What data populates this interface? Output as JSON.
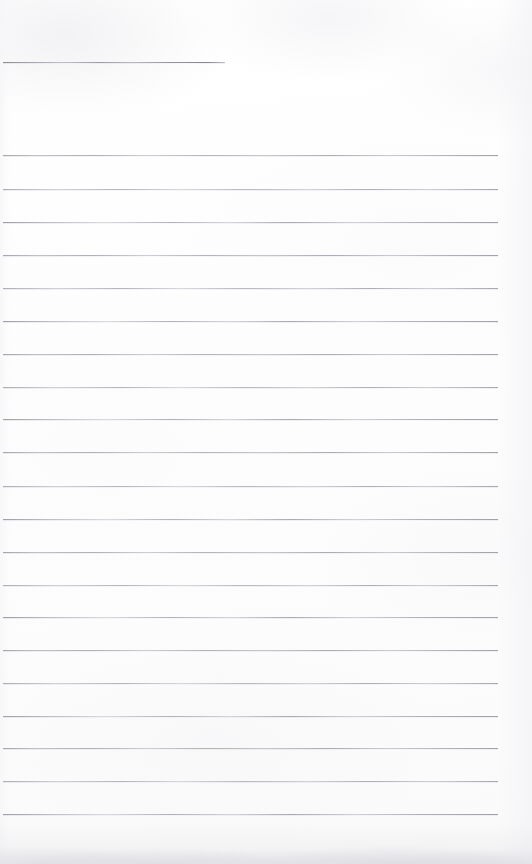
{
  "document": {
    "kind": "scanned-lined-paper",
    "width": 532,
    "height": 864
  },
  "colors": {
    "paper": "#fdfdfd",
    "rule_ink": "#a0a0ac",
    "rule_ink_dark": "#8a8a96",
    "shadow": "#d6d6db"
  },
  "layout": {
    "rule_left": 3,
    "rule_right": 498,
    "rule_spacing": 33.3
  },
  "header_rule": {
    "name": "title-rule",
    "top": 62,
    "left": 3,
    "width": 222,
    "text": ""
  },
  "rules": [
    {
      "top": 155,
      "left": 3,
      "width": 495,
      "variant": "v1",
      "text": ""
    },
    {
      "top": 189,
      "left": 3,
      "width": 495,
      "variant": "v2",
      "text": ""
    },
    {
      "top": 222,
      "left": 3,
      "width": 495,
      "variant": "v3",
      "text": ""
    },
    {
      "top": 255,
      "left": 3,
      "width": 495,
      "variant": "v1",
      "text": ""
    },
    {
      "top": 288,
      "left": 3,
      "width": 495,
      "variant": "v2",
      "text": ""
    },
    {
      "top": 321,
      "left": 3,
      "width": 495,
      "variant": "v3",
      "text": ""
    },
    {
      "top": 354,
      "left": 3,
      "width": 495,
      "variant": "v1",
      "text": ""
    },
    {
      "top": 387,
      "left": 3,
      "width": 495,
      "variant": "v2",
      "text": ""
    },
    {
      "top": 419,
      "left": 3,
      "width": 495,
      "variant": "v3",
      "text": ""
    },
    {
      "top": 452,
      "left": 3,
      "width": 495,
      "variant": "v1",
      "text": ""
    },
    {
      "top": 486,
      "left": 3,
      "width": 495,
      "variant": "v2",
      "text": ""
    },
    {
      "top": 519,
      "left": 3,
      "width": 495,
      "variant": "v3",
      "text": ""
    },
    {
      "top": 552,
      "left": 3,
      "width": 495,
      "variant": "v1",
      "text": ""
    },
    {
      "top": 585,
      "left": 3,
      "width": 495,
      "variant": "v2",
      "text": ""
    },
    {
      "top": 617,
      "left": 3,
      "width": 495,
      "variant": "v3",
      "text": ""
    },
    {
      "top": 650,
      "left": 3,
      "width": 495,
      "variant": "v1",
      "text": ""
    },
    {
      "top": 683,
      "left": 3,
      "width": 495,
      "variant": "v2",
      "text": ""
    },
    {
      "top": 716,
      "left": 3,
      "width": 495,
      "variant": "v3",
      "text": ""
    },
    {
      "top": 748,
      "left": 3,
      "width": 495,
      "variant": "v1",
      "text": ""
    },
    {
      "top": 781,
      "left": 3,
      "width": 495,
      "variant": "v2",
      "text": ""
    },
    {
      "top": 814,
      "left": 3,
      "width": 495,
      "variant": "v3",
      "text": ""
    }
  ],
  "handwriting": []
}
